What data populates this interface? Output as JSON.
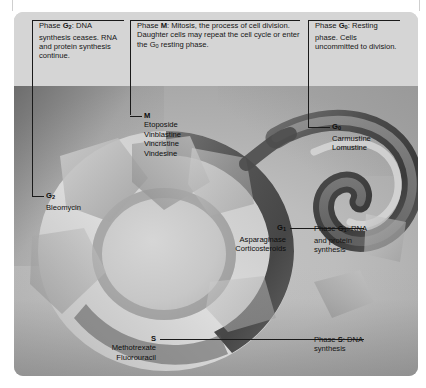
{
  "document": {
    "clipped_top_line": "·  ·   ·   ·   ·"
  },
  "figure": {
    "background_color": "#d3d3d3",
    "art_background_color": "#bdbdbd"
  },
  "captions": [
    {
      "id": "g2",
      "segments": [
        {
          "text": "Phase ",
          "bold": false
        },
        {
          "text": "G",
          "bold": true
        },
        {
          "text": "2",
          "bold": true,
          "sub": true
        },
        {
          "text": ": DNA synthesis ceases. RNA and protein synthesis continue.",
          "bold": false
        }
      ],
      "plain": "Phase G2: DNA synthesis ceases. RNA and protein synthesis continue."
    },
    {
      "id": "m",
      "segments": [
        {
          "text": "Phase ",
          "bold": false
        },
        {
          "text": "M",
          "bold": true
        },
        {
          "text": ": Mitosis, the process of cell division. Daughter cells may repeat the cell cycle or enter the G",
          "bold": false
        },
        {
          "text": "0",
          "bold": false,
          "sub": true
        },
        {
          "text": " resting phase.",
          "bold": false
        }
      ],
      "plain": "Phase M: Mitosis, the process of cell division. Daughter cells may repeat the cell cycle or enter the G0 resting phase."
    },
    {
      "id": "g0",
      "segments": [
        {
          "text": "Phase ",
          "bold": false
        },
        {
          "text": "G",
          "bold": true
        },
        {
          "text": "0",
          "bold": true,
          "sub": true
        },
        {
          "text": ": Resting phase. Cells uncommitted to division.",
          "bold": false
        }
      ],
      "plain": "Phase G0: Resting phase. Cells uncommitted to division."
    }
  ],
  "drug_labels": [
    {
      "id": "m",
      "phase": "M",
      "phase_sub": "",
      "drugs": [
        "Etoposide",
        "Vinblastine",
        "Vincristine",
        "Vindesine"
      ]
    },
    {
      "id": "g0",
      "phase": "G",
      "phase_sub": "0",
      "drugs": [
        "Carmustine",
        "Lomustine"
      ]
    },
    {
      "id": "g2",
      "phase": "G",
      "phase_sub": "2",
      "drugs": [
        "Bleomycin"
      ]
    },
    {
      "id": "g1",
      "phase": "G",
      "phase_sub": "1",
      "drugs": [
        "Asparaginase",
        "Corticosteroids"
      ]
    },
    {
      "id": "s",
      "phase": "S",
      "phase_sub": "",
      "drugs": [
        "Methotrexate",
        "Fluorouracil"
      ]
    }
  ],
  "side_callouts": [
    {
      "id": "g1",
      "lines": [
        "Phase G1: RNA",
        "and protein",
        "synthesis"
      ],
      "phase": "G",
      "phase_sub": "1",
      "plain": "Phase G1: RNA and protein synthesis"
    },
    {
      "id": "s",
      "lines": [
        "Phase S: DNA",
        "synthesis"
      ],
      "phase": "S",
      "phase_sub": "",
      "plain": "Phase S: DNA synthesis"
    }
  ]
}
